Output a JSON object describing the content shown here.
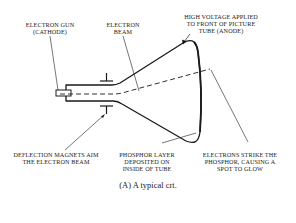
{
  "labels": {
    "electron_gun": [
      "ELECTRON GUN",
      "(CATHODE)"
    ],
    "electron_beam": [
      "ELECTRON",
      "BEAM"
    ],
    "high_voltage": [
      "HIGH VOLTAGE APPLIED",
      "TO FRONT OF PICTURE",
      "TUBE (ANODE)"
    ],
    "deflection": [
      "DEFLECTION MAGNETS AIM",
      "THE ELECTRON BEAM"
    ],
    "phosphor_layer": [
      "PHOSPHOR LAYER",
      "DEPOSITED ON",
      "INSIDE OF TUBE"
    ],
    "electrons_strike": [
      "ELECTRONS STRIKE THE",
      "PHOSPHOR, CAUSING A",
      "SPOT TO GLOW"
    ]
  },
  "caption": "(A) A typical crt.",
  "colors": {
    "line": "#1a1a1a",
    "background": "#ffffff"
  }
}
